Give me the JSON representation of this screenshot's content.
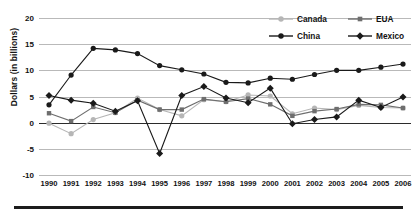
{
  "chart_data": {
    "type": "line",
    "title": "",
    "xlabel": "",
    "ylabel": "Dollars (in billions)",
    "x": [
      1990,
      1991,
      1992,
      1993,
      1994,
      1995,
      1996,
      1997,
      1998,
      1999,
      2000,
      2001,
      2002,
      2003,
      2004,
      2005,
      2006
    ],
    "categories": [
      "1990",
      "1991",
      "1992",
      "1993",
      "1994",
      "1995",
      "1996",
      "1997",
      "1998",
      "1999",
      "2000",
      "2001",
      "2002",
      "2003",
      "2004",
      "2005",
      "2006"
    ],
    "ylim": [
      -10,
      20
    ],
    "yticks": [
      20,
      15,
      10,
      5,
      0,
      -5,
      -10
    ],
    "yticklabels": [
      "20",
      "15",
      "10",
      "5",
      "0",
      "-5",
      "-10"
    ],
    "grid": true,
    "legend_position": "top-right",
    "series": [
      {
        "name": "Canada",
        "color": "#b6b6b6",
        "marker": "circle",
        "values": [
          -0.1,
          -2.1,
          0.6,
          1.9,
          4.7,
          2.5,
          1.3,
          4.4,
          4.0,
          5.3,
          5.1,
          1.7,
          2.8,
          2.5,
          3.3,
          2.9,
          2.8
        ]
      },
      {
        "name": "EUA",
        "color": "#6e6e6e",
        "marker": "square",
        "values": [
          1.8,
          0.3,
          3.0,
          1.9,
          4.3,
          2.5,
          2.5,
          4.5,
          4.0,
          4.6,
          3.5,
          1.3,
          2.2,
          2.6,
          3.5,
          3.4,
          2.8
        ]
      },
      {
        "name": "China",
        "color": "#1a1a1a",
        "marker": "circle",
        "values": [
          3.4,
          9.1,
          14.2,
          13.9,
          13.2,
          10.9,
          10.1,
          9.3,
          7.7,
          7.6,
          8.5,
          8.3,
          9.2,
          10.0,
          10.0,
          10.6,
          11.2
        ]
      },
      {
        "name": "Mexico",
        "color": "#1a1a1a",
        "marker": "diamond",
        "values": [
          5.2,
          4.3,
          3.7,
          2.2,
          4.2,
          -5.9,
          5.2,
          6.9,
          4.7,
          3.8,
          6.6,
          -0.2,
          0.6,
          1.1,
          4.3,
          2.9,
          4.9
        ]
      }
    ]
  },
  "legend": {
    "items": [
      {
        "label": "Canada"
      },
      {
        "label": "EUA"
      },
      {
        "label": "China"
      },
      {
        "label": "Mexico"
      }
    ]
  }
}
